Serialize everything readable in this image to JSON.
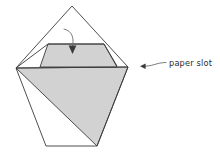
{
  "figure": {
    "title": "",
    "type": "origami-fold-diagram",
    "background_color": "#ffffff",
    "stroke_color": "#3a3a3a",
    "fill_color": "#d2d2d2",
    "annotation_color": "#2b2b2b"
  },
  "labels": {
    "paper_slot": "paper slot"
  },
  "annotations": {
    "fold_arrow": {
      "name": "fold-down-arrow",
      "direction": "down",
      "description": "curved arrow pointing down into the flap"
    },
    "slot_pointer": {
      "name": "paper-slot-pointer",
      "direction": "left",
      "description": "curved leader line with arrowhead pointing at the slot edge"
    }
  },
  "shapes": {
    "outer_kite": {
      "name": "outer-paper-outline",
      "points": "72,6 128,67 97,146 46,146 16,68"
    },
    "left_flap": {
      "name": "left-folded-flap",
      "points": "16,68 48,44 104,44 117,66"
    },
    "shaded_trapezoid": {
      "name": "folded-flap-shaded",
      "points": "48,44 104,44 117,67 40,67"
    },
    "shaded_triangle": {
      "name": "front-layer-shaded",
      "points": "16,68 128,67 97,146"
    },
    "slot_line": {
      "name": "paper-slot-edge",
      "points": "16,68 128,67"
    }
  }
}
